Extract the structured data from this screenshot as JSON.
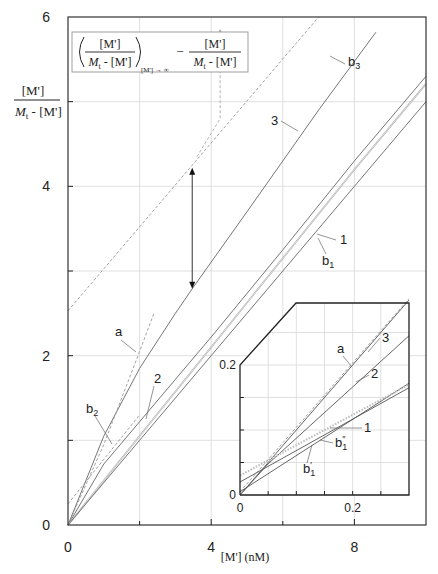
{
  "chart_data": {
    "type": "line",
    "title": "",
    "xlabel": "[M'] (nM)",
    "ylabel": "[M'] / (M_t - [M'])",
    "ylabel_parts": {
      "num": "[M']",
      "den_italic": "M",
      "den_sub": "t",
      "den_rest": " - [M']"
    },
    "xlim": [
      0,
      10
    ],
    "ylim": [
      0,
      6
    ],
    "x_ticks": [
      0,
      2,
      4,
      6,
      8
    ],
    "x_tick_labels": [
      "0",
      "4",
      "8"
    ],
    "x_tick_label_values": [
      0,
      4,
      8
    ],
    "y_ticks": [
      0,
      1,
      2,
      3,
      4,
      5,
      6
    ],
    "y_tick_labels": [
      "0",
      "2",
      "4",
      "6"
    ],
    "y_tick_label_values": [
      0,
      2,
      4,
      6
    ],
    "grid": true,
    "annotation_box": {
      "term1_num": "[M']",
      "term1_den_italic": "M",
      "term1_den_sub": "t",
      "term1_den_rest": " - [M']",
      "term1_subscript": "[M'] → ∞",
      "minus": "−",
      "term2_num": "[M']",
      "term2_den_italic": "M",
      "term2_den_sub": "t",
      "term2_den_rest": " - [M']"
    },
    "series": [
      {
        "name": "b3",
        "style": "dashed",
        "x": [
          0,
          7.0
        ],
        "y": [
          2.53,
          6.0
        ]
      },
      {
        "name": "3",
        "style": "solid",
        "x": [
          0,
          1,
          2,
          3,
          3.47,
          5,
          7,
          8.6
        ],
        "y": [
          0,
          1.05,
          1.85,
          2.5,
          2.79,
          3.7,
          4.9,
          5.82
        ]
      },
      {
        "name": "a",
        "style": "dashed",
        "x": [
          0,
          1.0,
          2.0,
          2.4
        ],
        "y": [
          0,
          0.95,
          2.05,
          2.5
        ]
      },
      {
        "name": "b2",
        "style": "dashed",
        "x": [
          0,
          2.0
        ],
        "y": [
          0.25,
          1.3
        ]
      },
      {
        "name": "2",
        "style": "solid",
        "x": [
          0,
          1.0,
          1.8,
          4,
          6,
          8,
          10
        ],
        "y": [
          0,
          0.72,
          1.12,
          2.22,
          3.25,
          4.3,
          5.3
        ]
      },
      {
        "name": "1",
        "style": "solid",
        "x": [
          0,
          2,
          4,
          6,
          8,
          10
        ],
        "y": [
          0,
          1.05,
          2.1,
          3.15,
          4.2,
          5.21
        ]
      },
      {
        "name": "b1",
        "style": "solid",
        "x": [
          0,
          2,
          4,
          6,
          8,
          10
        ],
        "y": [
          0,
          1.0,
          2.0,
          3.0,
          4.0,
          5.0
        ]
      }
    ],
    "annotations": [
      {
        "type": "double-arrow",
        "x": 3.47,
        "y_from": 2.79,
        "y_to": 4.22
      },
      {
        "type": "dashed-arrow",
        "path_x": [
          3.6,
          4.25,
          4.25
        ],
        "path_y": [
          4.35,
          4.8,
          5.85
        ]
      }
    ],
    "labels": [
      {
        "text": "b",
        "sub": "3",
        "x": 348,
        "y": 66
      },
      {
        "text": "3",
        "sub": "",
        "x": 271,
        "y": 125
      },
      {
        "text": "1",
        "sub": "",
        "x": 340,
        "y": 244
      },
      {
        "text": "b",
        "sub": "1",
        "x": 322,
        "y": 265
      },
      {
        "text": "a",
        "sub": "",
        "x": 115,
        "y": 336
      },
      {
        "text": "2",
        "sub": "",
        "x": 154,
        "y": 383
      },
      {
        "text": "b",
        "sub": "2",
        "x": 86,
        "y": 413
      }
    ],
    "inset": {
      "xlim": [
        0,
        0.3
      ],
      "ylim": [
        0,
        0.3
      ],
      "x_ticks": [
        0,
        0.05,
        0.1,
        0.15,
        0.2,
        0.25,
        0.3
      ],
      "x_tick_labels": [
        "0",
        "0.2"
      ],
      "x_tick_label_values": [
        0,
        0.2
      ],
      "y_ticks": [
        0,
        0.05,
        0.1,
        0.15,
        0.2,
        0.25
      ],
      "y_tick_labels": [
        "0",
        "0.2"
      ],
      "y_tick_label_values": [
        0,
        0.2
      ],
      "grid": true,
      "series": [
        {
          "name": "a",
          "style": "dashed",
          "x": [
            0,
            0.3
          ],
          "y": [
            0.005,
            0.302
          ]
        },
        {
          "name": "3",
          "style": "solid",
          "x": [
            0,
            0.05,
            0.3
          ],
          "y": [
            0,
            0.05,
            0.3
          ]
        },
        {
          "name": "2",
          "style": "solid",
          "x": [
            0,
            0.05,
            0.3
          ],
          "y": [
            0,
            0.048,
            0.245
          ]
        },
        {
          "name": "1",
          "style": "solid",
          "x": [
            0,
            0.3
          ],
          "y": [
            0.005,
            0.172
          ]
        },
        {
          "name": "b1''",
          "style": "dotted",
          "x": [
            0,
            0.3
          ],
          "y": [
            0.03,
            0.17
          ]
        },
        {
          "name": "b1'",
          "style": "solid",
          "x": [
            0,
            0.3
          ],
          "y": [
            0.02,
            0.165
          ]
        }
      ],
      "labels": [
        {
          "text": "a",
          "sub": "",
          "sup": "",
          "x": 337,
          "y": 353
        },
        {
          "text": "3",
          "sub": "",
          "sup": "",
          "x": 382,
          "y": 342
        },
        {
          "text": "2",
          "sub": "",
          "sup": "",
          "x": 371,
          "y": 378
        },
        {
          "text": "1",
          "sub": "",
          "sup": "",
          "x": 364,
          "y": 432
        },
        {
          "text": "b",
          "sub": "1",
          "sup": "″",
          "x": 335,
          "y": 447
        },
        {
          "text": "b",
          "sub": "1",
          "sup": "′",
          "x": 303,
          "y": 473
        }
      ]
    }
  }
}
